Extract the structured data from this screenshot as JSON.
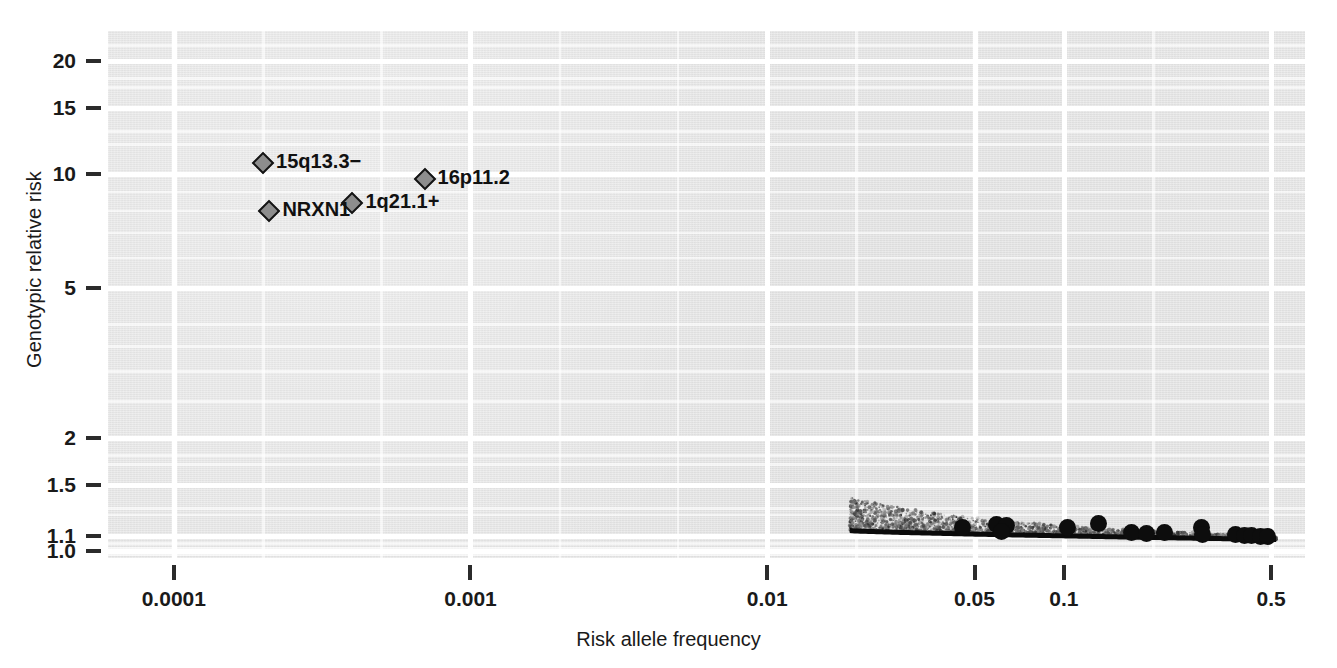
{
  "chart_data": {
    "type": "scatter",
    "title": "",
    "xlabel": "Risk allele frequency",
    "ylabel": "Genotypic relative risk",
    "xscale": "log",
    "yscale": "log",
    "xlim": [
      6e-05,
      0.65
    ],
    "ylim": [
      0.96,
      24
    ],
    "grid": true,
    "legend": "none",
    "xticks": [
      "0.0001",
      "0.001",
      "0.01",
      "0.05",
      "0.1",
      "0.5"
    ],
    "xtick_values": [
      0.0001,
      0.001,
      0.01,
      0.05,
      0.1,
      0.5
    ],
    "yticks": [
      "20",
      "15",
      "10",
      "5",
      "2",
      "1.5",
      "1.1",
      "1.0"
    ],
    "ytick_values": [
      20,
      15,
      10,
      5,
      2,
      1.5,
      1.1,
      1.0
    ],
    "series": [
      {
        "name": "Rare CNVs",
        "marker": "diamond",
        "marker_color": "#8d8d8d",
        "marker_edge": "#141414",
        "labelled": true,
        "points": [
          {
            "label": "15q13.3−",
            "x": 0.0002,
            "y": 10.7
          },
          {
            "label": "16p11.2",
            "x": 0.0007,
            "y": 9.7
          },
          {
            "label": "1q21.1+",
            "x": 0.0004,
            "y": 8.4
          },
          {
            "label": "NRXN1",
            "x": 0.00021,
            "y": 8.0
          }
        ]
      },
      {
        "name": "Common GWAS variants",
        "marker": "circle",
        "marker_color": "#0d0d0d",
        "labelled": false,
        "points": [
          {
            "x": 0.0455,
            "y": 1.155
          },
          {
            "x": 0.0595,
            "y": 1.175
          },
          {
            "x": 0.064,
            "y": 1.17
          },
          {
            "x": 0.0615,
            "y": 1.13
          },
          {
            "x": 0.103,
            "y": 1.16
          },
          {
            "x": 0.131,
            "y": 1.185
          },
          {
            "x": 0.169,
            "y": 1.125
          },
          {
            "x": 0.19,
            "y": 1.118
          },
          {
            "x": 0.218,
            "y": 1.122
          },
          {
            "x": 0.29,
            "y": 1.16
          },
          {
            "x": 0.293,
            "y": 1.108
          },
          {
            "x": 0.38,
            "y": 1.105
          },
          {
            "x": 0.405,
            "y": 1.102
          },
          {
            "x": 0.43,
            "y": 1.1
          },
          {
            "x": 0.46,
            "y": 1.098
          },
          {
            "x": 0.485,
            "y": 1.095
          }
        ]
      }
    ],
    "annotations": [
      {
        "name": "detection-boundary-curve",
        "description": "solid black boundary line with grey stippled cloud above it, spanning the common-frequency range",
        "x_start": 0.019,
        "x_end": 0.52,
        "y_start": 1.135,
        "y_end": 1.075
      }
    ]
  },
  "axes": {
    "ylabel": "Genotypic relative risk",
    "xlabel": "Risk allele frequency"
  }
}
